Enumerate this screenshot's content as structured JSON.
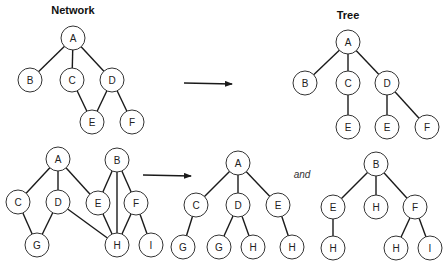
{
  "titles": {
    "network": "Network",
    "tree": "Tree"
  },
  "conjunction": "and",
  "arrows": [
    {
      "name": "network-to-tree-arrow-top"
    },
    {
      "name": "network-to-tree-arrow-bottom"
    }
  ],
  "graphs": [
    {
      "name": "network-top",
      "nodes": [
        {
          "id": "A",
          "label": "A"
        },
        {
          "id": "B",
          "label": "B"
        },
        {
          "id": "C",
          "label": "C"
        },
        {
          "id": "D",
          "label": "D"
        },
        {
          "id": "E",
          "label": "E"
        },
        {
          "id": "F",
          "label": "F"
        }
      ],
      "edges": [
        [
          "A",
          "B"
        ],
        [
          "A",
          "C"
        ],
        [
          "A",
          "D"
        ],
        [
          "C",
          "E"
        ],
        [
          "D",
          "E"
        ],
        [
          "D",
          "F"
        ]
      ]
    },
    {
      "name": "tree-top",
      "nodes": [
        {
          "id": "A",
          "label": "A"
        },
        {
          "id": "B",
          "label": "B"
        },
        {
          "id": "C",
          "label": "C"
        },
        {
          "id": "D",
          "label": "D"
        },
        {
          "id": "E1",
          "label": "E"
        },
        {
          "id": "E2",
          "label": "E"
        },
        {
          "id": "F",
          "label": "F"
        }
      ],
      "edges": [
        [
          "A",
          "B"
        ],
        [
          "A",
          "C"
        ],
        [
          "A",
          "D"
        ],
        [
          "C",
          "E1"
        ],
        [
          "D",
          "E2"
        ],
        [
          "D",
          "F"
        ]
      ]
    },
    {
      "name": "network-bottom",
      "nodes": [
        {
          "id": "A",
          "label": "A"
        },
        {
          "id": "B",
          "label": "B"
        },
        {
          "id": "C",
          "label": "C"
        },
        {
          "id": "D",
          "label": "D"
        },
        {
          "id": "E",
          "label": "E"
        },
        {
          "id": "F",
          "label": "F"
        },
        {
          "id": "G",
          "label": "G"
        },
        {
          "id": "H",
          "label": "H"
        },
        {
          "id": "I",
          "label": "I"
        }
      ],
      "edges": [
        [
          "A",
          "C"
        ],
        [
          "A",
          "D"
        ],
        [
          "A",
          "E"
        ],
        [
          "C",
          "G"
        ],
        [
          "D",
          "G"
        ],
        [
          "D",
          "H"
        ],
        [
          "E",
          "H"
        ],
        [
          "B",
          "E"
        ],
        [
          "B",
          "H"
        ],
        [
          "B",
          "F"
        ],
        [
          "F",
          "H"
        ],
        [
          "F",
          "I"
        ]
      ]
    },
    {
      "name": "tree-bottom-a",
      "nodes": [
        {
          "id": "A",
          "label": "A"
        },
        {
          "id": "C",
          "label": "C"
        },
        {
          "id": "D",
          "label": "D"
        },
        {
          "id": "E",
          "label": "E"
        },
        {
          "id": "G1",
          "label": "G"
        },
        {
          "id": "G2",
          "label": "G"
        },
        {
          "id": "H1",
          "label": "H"
        },
        {
          "id": "H2",
          "label": "H"
        }
      ],
      "edges": [
        [
          "A",
          "C"
        ],
        [
          "A",
          "D"
        ],
        [
          "A",
          "E"
        ],
        [
          "C",
          "G1"
        ],
        [
          "D",
          "G2"
        ],
        [
          "D",
          "H1"
        ],
        [
          "E",
          "H2"
        ]
      ]
    },
    {
      "name": "tree-bottom-b",
      "nodes": [
        {
          "id": "B",
          "label": "B"
        },
        {
          "id": "E",
          "label": "E"
        },
        {
          "id": "H1",
          "label": "H"
        },
        {
          "id": "F",
          "label": "F"
        },
        {
          "id": "H2",
          "label": "H"
        },
        {
          "id": "H3",
          "label": "H"
        },
        {
          "id": "I",
          "label": "I"
        }
      ],
      "edges": [
        [
          "B",
          "E"
        ],
        [
          "B",
          "H1"
        ],
        [
          "B",
          "F"
        ],
        [
          "E",
          "H2"
        ],
        [
          "F",
          "H3"
        ],
        [
          "F",
          "I"
        ]
      ]
    }
  ]
}
